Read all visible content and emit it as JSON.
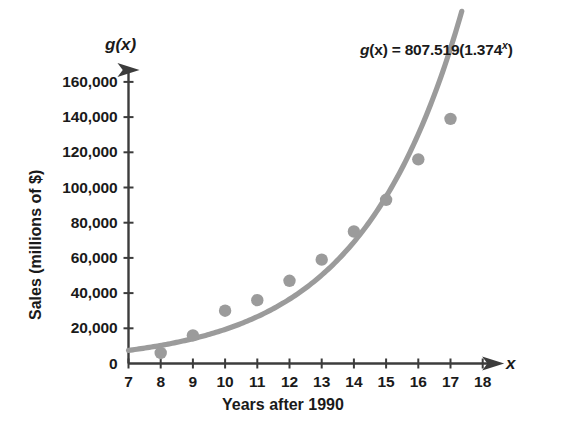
{
  "chart_data": {
    "type": "scatter",
    "title": "",
    "xlabel": "Years after 1990",
    "ylabel": "Sales (millions of $)",
    "x_axis_name": "x",
    "y_axis_name": "g(x)",
    "xlim": [
      7,
      18
    ],
    "ylim": [
      0,
      170000
    ],
    "grid": false,
    "legend": "none",
    "x_ticks": [
      "7",
      "8",
      "9",
      "10",
      "11",
      "12",
      "13",
      "14",
      "15",
      "16",
      "17",
      "18"
    ],
    "x_tick_values": [
      7,
      8,
      9,
      10,
      11,
      12,
      13,
      14,
      15,
      16,
      17,
      18
    ],
    "y_ticks": [
      "0",
      "20,000",
      "40,000",
      "60,000",
      "80,000",
      "100,000",
      "120,000",
      "140,000",
      "160,000"
    ],
    "y_tick_values": [
      0,
      20000,
      40000,
      60000,
      80000,
      100000,
      120000,
      140000,
      160000
    ],
    "x": [
      8,
      9,
      10,
      11,
      12,
      13,
      14,
      15,
      16,
      17
    ],
    "values": [
      6000,
      16000,
      30000,
      36000,
      47000,
      59000,
      75000,
      93000,
      116000,
      139000
    ],
    "series": [
      {
        "name": "Sales data points",
        "type": "scatter",
        "x": [
          8,
          9,
          10,
          11,
          12,
          13,
          14,
          15,
          16,
          17
        ],
        "values": [
          6000,
          16000,
          30000,
          36000,
          47000,
          59000,
          75000,
          93000,
          116000,
          139000
        ],
        "color": "#9b9b9b"
      },
      {
        "name": "Exponential regression curve",
        "type": "line",
        "equation_a": 807.519,
        "equation_b": 1.374,
        "x_range": [
          7,
          17.35
        ],
        "color": "#9b9b9b"
      }
    ],
    "annotations": [
      {
        "name": "equation",
        "prefix": "g",
        "arg": "(x)",
        "eq": " = 807.519(1.374",
        "exponent": "x",
        "suffix": ")",
        "text": "g(x) = 807.519(1.374^x)"
      }
    ]
  },
  "axis": {
    "y_name": "g(x)",
    "x_name": "x",
    "y_title": "Sales (millions of $)",
    "x_title": "Years after 1990"
  },
  "colors": {
    "data": "#9b9b9b",
    "curve": "#9b9b9b",
    "axis": "#3c3c3c",
    "text": "#1a1a1a",
    "background": "#ffffff"
  }
}
